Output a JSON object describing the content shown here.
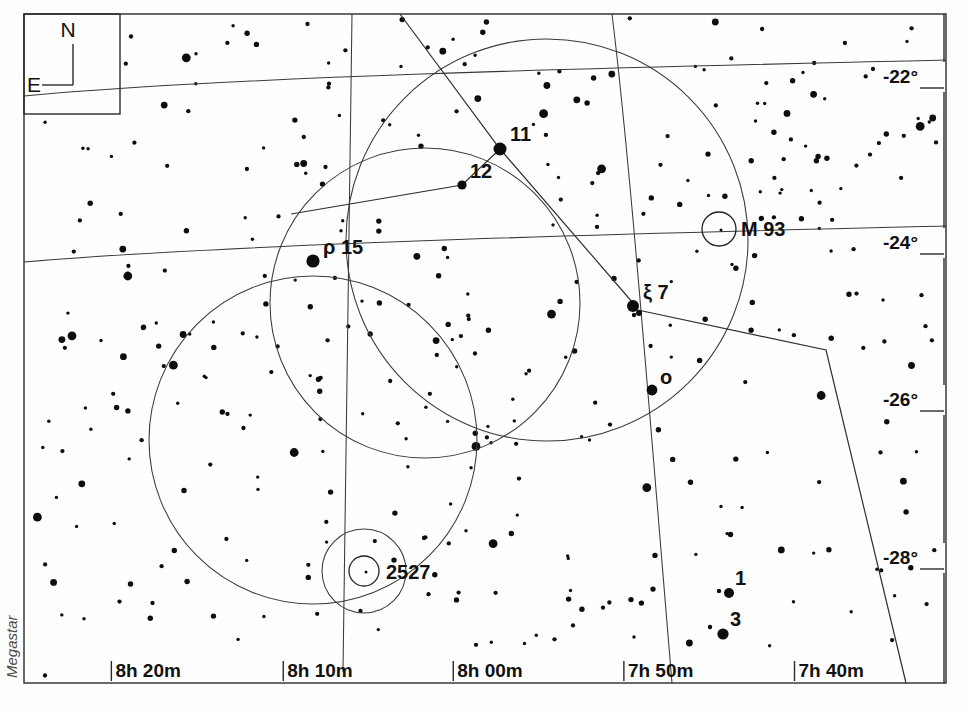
{
  "chart_data": {
    "type": "scatter",
    "xlabel": "Right Ascension",
    "ylabel": "Declination",
    "grid": true,
    "legend_position": "none",
    "x_axis": {
      "unit": "hours/minutes of Right Ascension",
      "direction": "increasing to the left",
      "tick_labels": [
        "8h 20m",
        "8h 10m",
        "8h 00m",
        "7h 50m",
        "7h 40m"
      ],
      "tick_x_px": [
        175,
        450,
        722,
        995,
        1268
      ]
    },
    "y_axis": {
      "unit": "degrees of Declination",
      "tick_labels": [
        "-22°",
        "-24°",
        "-26°",
        "-28°"
      ],
      "tick_y_px": [
        76,
        242,
        399,
        557
      ]
    },
    "named_stars": [
      {
        "label": "11",
        "x": 500,
        "y": 149,
        "mag_px": 6.5,
        "label_dx": 10,
        "label_dy": -8
      },
      {
        "label": "12",
        "x": 462,
        "y": 185,
        "mag_px": 4.6,
        "label_dx": 8,
        "label_dy": -7
      },
      {
        "label": "ρ  15",
        "x": 313,
        "y": 261,
        "mag_px": 6.6,
        "label_dx": 10,
        "label_dy": -7
      },
      {
        "label": "ξ 7",
        "x": 633,
        "y": 306,
        "mag_px": 6.0,
        "label_dx": 10,
        "label_dy": -7
      },
      {
        "label": "o",
        "x": 652,
        "y": 390,
        "mag_px": 5.4,
        "label_dx": 8,
        "label_dy": -6
      },
      {
        "label": "1",
        "x": 729,
        "y": 593,
        "mag_px": 5.0,
        "label_dx": 6,
        "label_dy": -8
      },
      {
        "label": "3",
        "x": 723,
        "y": 634,
        "mag_px": 5.6,
        "label_dx": 7,
        "label_dy": -8
      }
    ],
    "deep_sky_objects": [
      {
        "label": "M 93",
        "x": 719,
        "y": 229,
        "r": 17,
        "label_dx": 22,
        "label_dy": 7
      },
      {
        "label": "2527",
        "x": 364,
        "y": 571,
        "r": 15,
        "label_dx": 22,
        "label_dy": 8
      }
    ],
    "field_of_view_circles": [
      {
        "cx": 313,
        "cy": 440,
        "r": 164
      },
      {
        "cx": 425,
        "cy": 303,
        "r": 155
      },
      {
        "cx": 547,
        "cy": 240,
        "r": 201
      }
    ],
    "dso_outer_circles": [
      {
        "cx": 364,
        "cy": 571,
        "r": 42
      }
    ],
    "constellation_segments": [
      [
        [
          400,
          14
        ],
        [
          500,
          149
        ],
        [
          633,
          303
        ]
      ],
      [
        [
          291,
          214
        ],
        [
          462,
          185
        ],
        [
          500,
          149
        ]
      ],
      [
        [
          633,
          309
        ],
        [
          826,
          350
        ],
        [
          906,
          683
        ]
      ]
    ],
    "ra_gridlines": [
      "M 352 14 C 348 180, 345 420, 343 672",
      "M 612 14 C 630 160, 650 420, 672 683"
    ],
    "dec_gridlines": [
      "M 24 96 C 260 74, 700 66, 946 60",
      "M 24 262 C 260 242, 700 232, 946 226"
    ],
    "star_count": 372
  },
  "compass": {
    "north_label": "N",
    "east_label": "E"
  },
  "watermark": {
    "text": "Megastar"
  },
  "frame": {
    "left": 24,
    "top": 14,
    "right": 946,
    "bottom": 683
  }
}
